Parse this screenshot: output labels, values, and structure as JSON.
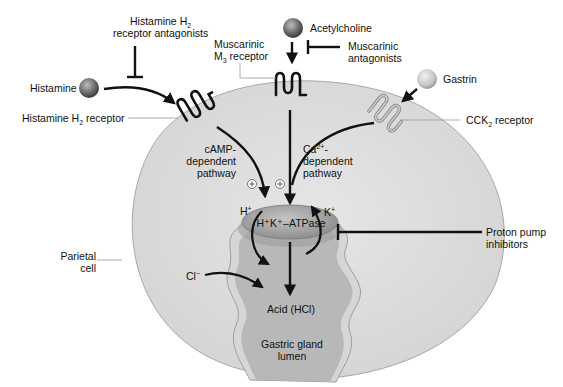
{
  "diagram": {
    "colors": {
      "cell_fill": "#dedede",
      "cell_edge": "#a8a8a8",
      "lumen_fill": "#b9b9b9",
      "lumen_border": "#d4d4d4",
      "atpase_fill": "#a9a9a9",
      "arrow": "#111111",
      "background": "#ffffff"
    },
    "ligands": [
      {
        "name": "Histamine",
        "icon": "histamine-sphere-icon",
        "shade": "dark"
      },
      {
        "name": "Acetylcholine",
        "icon": "acetylcholine-sphere-icon",
        "shade": "dark"
      },
      {
        "name": "Gastrin",
        "icon": "gastrin-sphere-icon",
        "shade": "light"
      }
    ],
    "receptors": [
      {
        "name": "Histamine H",
        "sub": "2",
        "suffix": " receptor"
      },
      {
        "name": "Muscarinic",
        "line2": "M",
        "sub": "3",
        "suffix": " receptor"
      },
      {
        "name": "CCK",
        "sub": "2",
        "suffix": " receptor"
      }
    ],
    "antagonists": [
      {
        "line1": "Histamine H",
        "sub": "2",
        "line2": "receptor antagonists"
      },
      {
        "line1": "Muscarinic",
        "line2": "antagonists"
      },
      {
        "line1": "Proton pump",
        "line2": "inhibitors"
      }
    ],
    "pathways": [
      {
        "line1": "cAMP-",
        "line2": "dependent",
        "line3": "pathway"
      },
      {
        "line1": "Ca",
        "sup": "2+",
        "line1_suffix": "-",
        "line2": "dependent",
        "line3": "pathway"
      }
    ],
    "plus_sign": "+",
    "pump": {
      "label": "H⁺K⁺–ATPase"
    },
    "ions": {
      "h": "H",
      "h_sup": "+",
      "k": "K",
      "k_sup": "+",
      "cl": "Cl",
      "cl_sup": "−"
    },
    "cell_label": {
      "line1": "Parietal",
      "line2": "cell"
    },
    "acid_label": "Acid (HCl)",
    "lumen_label": {
      "line1": "Gastric gland",
      "line2": "lumen"
    }
  }
}
